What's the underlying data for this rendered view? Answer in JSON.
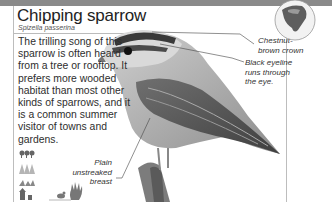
{
  "header": {
    "title": "Chipping sparrow",
    "scientific_name": "Spizella passerina"
  },
  "description": "The trilling song of this sparrow is often heard from a tree or rooftop. It prefers more wooded habitat than most other kinds of sparrows, and it is a common summer visitor of towns and gardens.",
  "callouts": {
    "crown": [
      "Chestnut-",
      "brown crown"
    ],
    "eyeline": [
      "Black eyeline",
      "runs through",
      "the eye."
    ],
    "breast": [
      "Plain",
      "unstreaked",
      "breast"
    ]
  },
  "icons": {
    "range_map": "north-america-range-map-icon",
    "habitats": [
      "deciduous-forest-icon",
      "coniferous-forest-icon",
      "grassland-icon",
      "town-icon"
    ],
    "behavior": [
      "ground-feeding-bird-icon",
      "hand-feeding-icon"
    ]
  },
  "colors": {
    "topbar": "#8a8a8a",
    "frame": "#bdbdbd"
  }
}
